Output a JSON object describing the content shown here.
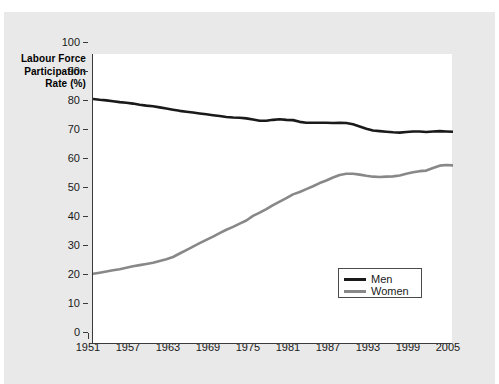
{
  "figure": {
    "background_color": "#e9e9e9",
    "panel_color": "#ffffff",
    "axis_color": "#3a3a3a"
  },
  "axis_title": {
    "line1": "Labour Force",
    "line2": "Participation",
    "line3": "Rate (%)"
  },
  "legend": {
    "position": "inside-lower-right",
    "entries": [
      {
        "label": "Men",
        "color": "#1a1a1a"
      },
      {
        "label": "Women",
        "color": "#888888"
      }
    ]
  },
  "chart_data": {
    "type": "line",
    "title": "",
    "subtitle": "",
    "xlabel": "",
    "ylabel": "Labour Force Participation Rate (%)",
    "xlim": [
      1951,
      2005
    ],
    "ylim": [
      0,
      100
    ],
    "grid": false,
    "legend_position": "lower right inside plot",
    "x_tick_labels": [
      "1951",
      "1957",
      "1963",
      "1969",
      "1975",
      "1981",
      "1987",
      "1993",
      "1999",
      "2005"
    ],
    "x_tick_values": [
      1951,
      1957,
      1963,
      1969,
      1975,
      1981,
      1987,
      1993,
      1999,
      2005
    ],
    "x_minor_tick_interval": 1,
    "y_tick_labels": [
      "0",
      "10",
      "20",
      "30",
      "40",
      "50",
      "60",
      "70",
      "80",
      "90",
      "100"
    ],
    "y_tick_values": [
      0,
      10,
      20,
      30,
      40,
      50,
      60,
      70,
      80,
      90,
      100
    ],
    "x": [
      1951,
      1952,
      1953,
      1954,
      1955,
      1956,
      1957,
      1958,
      1959,
      1960,
      1961,
      1962,
      1963,
      1964,
      1965,
      1966,
      1967,
      1968,
      1969,
      1970,
      1971,
      1972,
      1973,
      1974,
      1975,
      1976,
      1977,
      1978,
      1979,
      1980,
      1981,
      1982,
      1983,
      1984,
      1985,
      1986,
      1987,
      1988,
      1989,
      1990,
      1991,
      1992,
      1993,
      1994,
      1995,
      1996,
      1997,
      1998,
      1999,
      2000,
      2001,
      2002,
      2003,
      2004,
      2005
    ],
    "series": [
      {
        "name": "Men",
        "color": "#1a1a1a",
        "line_width": 2.6,
        "values": [
          84.5,
          84.2,
          84.0,
          83.7,
          83.4,
          83.2,
          82.9,
          82.5,
          82.2,
          82.0,
          81.6,
          81.2,
          80.8,
          80.4,
          80.1,
          79.8,
          79.5,
          79.2,
          78.9,
          78.6,
          78.3,
          78.1,
          78.0,
          77.8,
          77.4,
          77.0,
          77.0,
          77.3,
          77.5,
          77.3,
          77.2,
          76.6,
          76.3,
          76.3,
          76.3,
          76.3,
          76.2,
          76.3,
          76.2,
          75.8,
          75.0,
          74.2,
          73.6,
          73.4,
          73.2,
          73.0,
          72.9,
          73.1,
          73.3,
          73.3,
          73.1,
          73.3,
          73.4,
          73.3,
          73.2
        ]
      },
      {
        "name": "Women",
        "color": "#888888",
        "line_width": 2.6,
        "values": [
          24.2,
          24.6,
          25.0,
          25.4,
          25.8,
          26.3,
          26.8,
          27.2,
          27.6,
          28.0,
          28.6,
          29.2,
          30.0,
          31.2,
          32.4,
          33.6,
          34.8,
          35.9,
          37.0,
          38.2,
          39.4,
          40.4,
          41.5,
          42.6,
          44.2,
          45.3,
          46.5,
          47.9,
          49.1,
          50.3,
          51.6,
          52.4,
          53.4,
          54.4,
          55.5,
          56.4,
          57.4,
          58.3,
          58.7,
          58.7,
          58.4,
          58.0,
          57.7,
          57.6,
          57.7,
          57.8,
          58.1,
          58.7,
          59.2,
          59.6,
          59.8,
          60.7,
          61.5,
          61.7,
          61.6
        ]
      }
    ]
  }
}
